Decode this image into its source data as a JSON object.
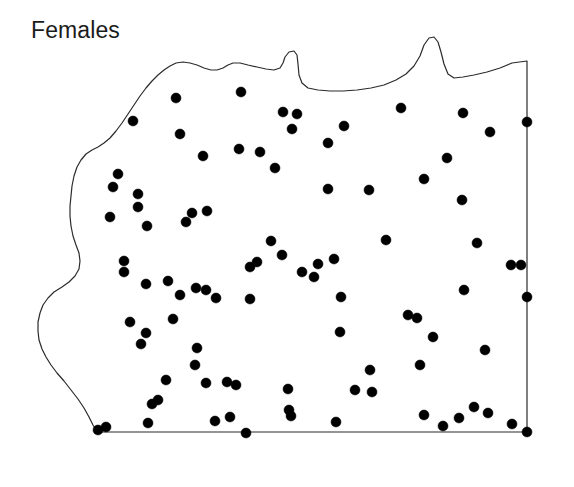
{
  "figure": {
    "title": "Females",
    "background_color": "#ffffff",
    "width": 574,
    "height": 487
  },
  "chart_data": {
    "type": "scatter",
    "title": "Females",
    "subtitle": "",
    "xlabel": "",
    "ylabel": "",
    "xlim": [
      0,
      574
    ],
    "ylim": [
      487,
      0
    ],
    "grid": false,
    "legend": null,
    "axes_visible": false,
    "tick_labels": {
      "x": [],
      "y": []
    },
    "annotations": [
      {
        "text": "Females",
        "x": 31,
        "y": 34,
        "role": "panel-label"
      }
    ],
    "marker": {
      "shape": "circle",
      "radius": 5.0,
      "color": "#000000",
      "edge_color": "#000000"
    },
    "boundary": {
      "name": "study-area-outline",
      "stroke": "#2b2b2b",
      "stroke_width": 1.2,
      "fill": "none",
      "description": "Irregular region: wavy natural border on north and west sides, straight ruled lines on east and south sides",
      "path": "M 98 432 L 527 432 L 527 61 L 512 63 L 500 68 L 487 72 L 474 75 L 463 77 L 454 78 L 448 74 L 444 64 L 441 52 L 438 42 L 434 37 L 429 38 L 424 45 L 420 56 L 414 66 L 406 74 L 396 80 L 384 85 L 371 88 L 357 90 L 343 91 L 330 91 L 318 90 L 308 88 L 302 83 L 299 75 L 298 64 L 297 55 L 294 51 L 289 52 L 285 57 L 283 63 L 280 68 L 274 70 L 266 69 L 257 67 L 248 65 L 240 63 L 233 63 L 228 65 L 223 68 L 217 70 L 211 70 L 204 68 L 197 65 L 190 63 L 183 62 L 176 63 L 170 66 L 164 70 L 158 75 L 152 81 L 146 88 L 140 96 L 134 105 L 128 114 L 122 123 L 116 131 L 110 138 L 104 143 L 98 147 L 92 150 L 86 154 L 81 160 L 77 167 L 74 176 L 72 186 L 71 196 L 70 206 L 70 216 L 71 226 L 73 236 L 76 245 L 79 253 L 80 261 L 79 269 L 75 276 L 69 282 L 62 287 L 54 292 L 48 298 L 43 305 L 40 313 L 38 322 L 38 331 L 39 340 L 42 349 L 46 357 L 51 365 L 57 373 L 64 381 L 71 390 L 78 399 L 84 408 L 89 417 L 93 425 L 96 430 Z"
    },
    "n_points": 92,
    "points": [
      {
        "x": 176,
        "y": 98
      },
      {
        "x": 241,
        "y": 92
      },
      {
        "x": 133,
        "y": 121
      },
      {
        "x": 180,
        "y": 134
      },
      {
        "x": 203,
        "y": 156
      },
      {
        "x": 239,
        "y": 149
      },
      {
        "x": 260,
        "y": 152
      },
      {
        "x": 275,
        "y": 168
      },
      {
        "x": 118,
        "y": 174
      },
      {
        "x": 138,
        "y": 194
      },
      {
        "x": 138,
        "y": 207
      },
      {
        "x": 110,
        "y": 217
      },
      {
        "x": 147,
        "y": 226
      },
      {
        "x": 192,
        "y": 213
      },
      {
        "x": 207,
        "y": 211
      },
      {
        "x": 124,
        "y": 261
      },
      {
        "x": 124,
        "y": 272
      },
      {
        "x": 146,
        "y": 284
      },
      {
        "x": 168,
        "y": 281
      },
      {
        "x": 180,
        "y": 295
      },
      {
        "x": 196,
        "y": 288
      },
      {
        "x": 206,
        "y": 290
      },
      {
        "x": 130,
        "y": 322
      },
      {
        "x": 146,
        "y": 333
      },
      {
        "x": 141,
        "y": 344
      },
      {
        "x": 166,
        "y": 380
      },
      {
        "x": 195,
        "y": 365
      },
      {
        "x": 206,
        "y": 383
      },
      {
        "x": 227,
        "y": 382
      },
      {
        "x": 236,
        "y": 385
      },
      {
        "x": 152,
        "y": 404
      },
      {
        "x": 158,
        "y": 400
      },
      {
        "x": 148,
        "y": 423
      },
      {
        "x": 98,
        "y": 430
      },
      {
        "x": 106,
        "y": 427
      },
      {
        "x": 215,
        "y": 421
      },
      {
        "x": 246,
        "y": 433
      },
      {
        "x": 271,
        "y": 241
      },
      {
        "x": 282,
        "y": 255
      },
      {
        "x": 328,
        "y": 143
      },
      {
        "x": 328,
        "y": 189
      },
      {
        "x": 369,
        "y": 190
      },
      {
        "x": 292,
        "y": 129
      },
      {
        "x": 302,
        "y": 272
      },
      {
        "x": 314,
        "y": 277
      },
      {
        "x": 289,
        "y": 410
      },
      {
        "x": 291,
        "y": 416
      },
      {
        "x": 297,
        "y": 114
      },
      {
        "x": 283,
        "y": 112
      },
      {
        "x": 344,
        "y": 126
      },
      {
        "x": 401,
        "y": 108
      },
      {
        "x": 463,
        "y": 113
      },
      {
        "x": 490,
        "y": 132
      },
      {
        "x": 527,
        "y": 122
      },
      {
        "x": 447,
        "y": 158
      },
      {
        "x": 424,
        "y": 179
      },
      {
        "x": 462,
        "y": 200
      },
      {
        "x": 477,
        "y": 243
      },
      {
        "x": 511,
        "y": 265
      },
      {
        "x": 521,
        "y": 265
      },
      {
        "x": 527,
        "y": 297
      },
      {
        "x": 464,
        "y": 290
      },
      {
        "x": 408,
        "y": 315
      },
      {
        "x": 417,
        "y": 318
      },
      {
        "x": 340,
        "y": 332
      },
      {
        "x": 386,
        "y": 240
      },
      {
        "x": 370,
        "y": 370
      },
      {
        "x": 420,
        "y": 365
      },
      {
        "x": 355,
        "y": 390
      },
      {
        "x": 372,
        "y": 392
      },
      {
        "x": 424,
        "y": 415
      },
      {
        "x": 459,
        "y": 418
      },
      {
        "x": 474,
        "y": 407
      },
      {
        "x": 488,
        "y": 413
      },
      {
        "x": 512,
        "y": 424
      },
      {
        "x": 527,
        "y": 432
      },
      {
        "x": 485,
        "y": 350
      },
      {
        "x": 443,
        "y": 426
      },
      {
        "x": 336,
        "y": 422
      },
      {
        "x": 318,
        "y": 264
      },
      {
        "x": 334,
        "y": 259
      },
      {
        "x": 288,
        "y": 389
      },
      {
        "x": 250,
        "y": 299
      },
      {
        "x": 216,
        "y": 298
      },
      {
        "x": 113,
        "y": 187
      },
      {
        "x": 186,
        "y": 222
      },
      {
        "x": 250,
        "y": 267
      },
      {
        "x": 257,
        "y": 262
      },
      {
        "x": 433,
        "y": 337
      },
      {
        "x": 341,
        "y": 297
      },
      {
        "x": 197,
        "y": 348
      },
      {
        "x": 173,
        "y": 319
      },
      {
        "x": 230,
        "y": 417
      }
    ]
  }
}
